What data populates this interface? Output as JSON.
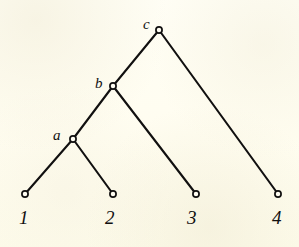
{
  "figure": {
    "type": "phylogenetic-tree",
    "width": 299,
    "height": 247,
    "background_color": "#fffdf2",
    "ink_color": "#111010"
  },
  "chart_data": {
    "type": "diagram",
    "subtype": "rooted-binary-tree",
    "title": "",
    "xlabel": "",
    "ylabel": "",
    "grid": false,
    "legend": null,
    "nodes": [
      {
        "id": "c",
        "label": "c",
        "kind": "internal",
        "x": 159,
        "y": 30,
        "label_x": 143,
        "label_y": 17
      },
      {
        "id": "b",
        "label": "b",
        "kind": "internal",
        "x": 113,
        "y": 86,
        "label_x": 95,
        "label_y": 76
      },
      {
        "id": "a",
        "label": "a",
        "kind": "internal",
        "x": 73,
        "y": 139,
        "label_x": 53,
        "label_y": 128
      },
      {
        "id": "leaf1",
        "label": "1",
        "kind": "leaf",
        "x": 25,
        "y": 194,
        "label_x": 19,
        "label_y": 208
      },
      {
        "id": "leaf2",
        "label": "2",
        "kind": "leaf",
        "x": 113,
        "y": 194,
        "label_x": 105,
        "label_y": 208
      },
      {
        "id": "leaf3",
        "label": "3",
        "kind": "leaf",
        "x": 196,
        "y": 194,
        "label_x": 187,
        "label_y": 208
      },
      {
        "id": "leaf4",
        "label": "4",
        "kind": "leaf",
        "x": 278,
        "y": 194,
        "label_x": 272,
        "label_y": 208
      }
    ],
    "edges": [
      {
        "from": "c",
        "to": "b",
        "x1": 159,
        "y1": 30,
        "x2": 113,
        "y2": 86
      },
      {
        "from": "c",
        "to": "leaf4",
        "x1": 159,
        "y1": 30,
        "x2": 278,
        "y2": 194
      },
      {
        "from": "b",
        "to": "a",
        "x1": 113,
        "y1": 86,
        "x2": 73,
        "y2": 139
      },
      {
        "from": "b",
        "to": "leaf3",
        "x1": 113,
        "y1": 86,
        "x2": 196,
        "y2": 194
      },
      {
        "from": "a",
        "to": "leaf1",
        "x1": 73,
        "y1": 139,
        "x2": 25,
        "y2": 194
      },
      {
        "from": "a",
        "to": "leaf2",
        "x1": 73,
        "y1": 139,
        "x2": 113,
        "y2": 194
      }
    ],
    "node_marker": {
      "shape": "circle",
      "radius": 3.1,
      "fill": "#fffdf2",
      "stroke": "#111010",
      "stroke_width": 1.7
    },
    "edge_style": {
      "stroke": "#111010",
      "stroke_width": 2.1,
      "linecap": "round"
    },
    "annotations": [
      "Internal nodes a, b, c are labelled to the upper-left of their markers.",
      "Leaves 1, 2, 3, 4 are labelled directly below their markers."
    ]
  }
}
